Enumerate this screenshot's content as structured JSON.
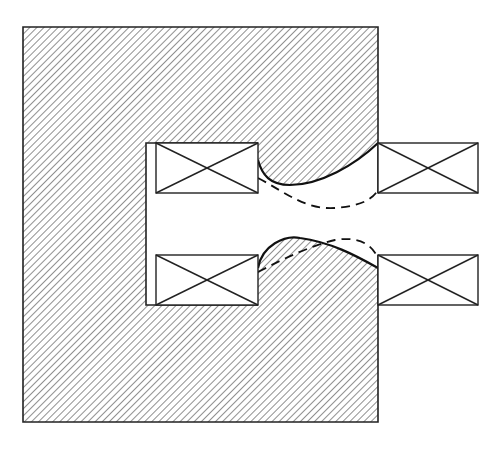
{
  "figure": {
    "colors": {
      "background": "#ffffff",
      "line": "#222222",
      "hatch": "#333333"
    },
    "yoke": {
      "x": 23,
      "y": 27,
      "width": 355,
      "height": 395
    },
    "cavity": {
      "x": 146,
      "y": 143,
      "width": 112,
      "height": 162
    },
    "coils": [
      {
        "id": "coil-upper-left",
        "x": 156,
        "y": 143,
        "width": 102,
        "height": 50
      },
      {
        "id": "coil-lower-left",
        "x": 156,
        "y": 255,
        "width": 102,
        "height": 50
      },
      {
        "id": "coil-upper-right",
        "x": 378,
        "y": 143,
        "width": 100,
        "height": 50
      },
      {
        "id": "coil-lower-right",
        "x": 378,
        "y": 255,
        "width": 100,
        "height": 50
      }
    ],
    "profiles": {
      "solid": "solid pole-tip boundary",
      "dashed": "alternative (dashed) pole-tip boundary"
    }
  }
}
